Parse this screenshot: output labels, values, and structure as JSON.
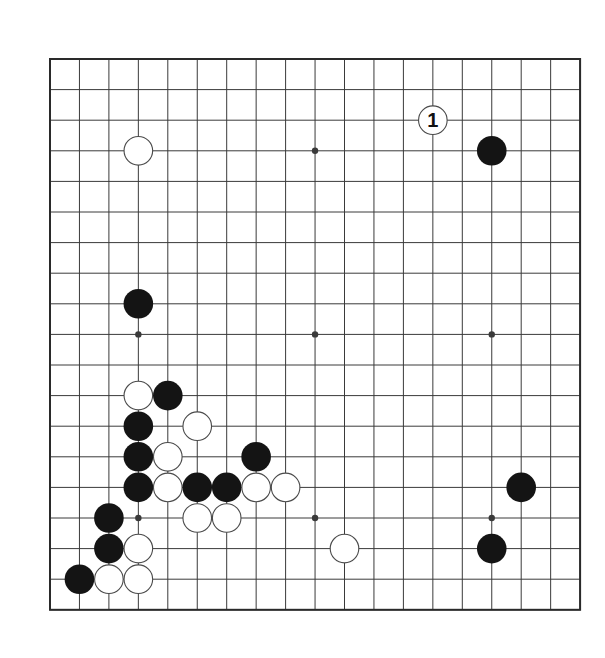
{
  "diagram": {
    "type": "go-board",
    "size": 19,
    "origin": {
      "x": 50,
      "y": 59
    },
    "spacing": {
      "x": 29.45,
      "y": 30.6
    },
    "stone_radius": 14.8,
    "colors": {
      "background": "#ffffff",
      "line": "#3a3a3a",
      "border": "#2a2a2a",
      "black_stone": "#141414",
      "white_stone_fill": "#ffffff",
      "white_stone_stroke": "#4a4a4a",
      "label": "#111111"
    },
    "star_points": [
      [
        3,
        3
      ],
      [
        9,
        3
      ],
      [
        15,
        3
      ],
      [
        3,
        9
      ],
      [
        9,
        9
      ],
      [
        15,
        9
      ],
      [
        3,
        15
      ],
      [
        9,
        15
      ],
      [
        15,
        15
      ]
    ],
    "stones": [
      {
        "col": 3,
        "row": 3,
        "color": "white"
      },
      {
        "col": 15,
        "row": 3,
        "color": "black"
      },
      {
        "col": 13,
        "row": 2,
        "color": "white",
        "label": "1"
      },
      {
        "col": 3,
        "row": 8,
        "color": "black"
      },
      {
        "col": 3,
        "row": 11,
        "color": "white"
      },
      {
        "col": 4,
        "row": 11,
        "color": "black"
      },
      {
        "col": 3,
        "row": 12,
        "color": "black"
      },
      {
        "col": 5,
        "row": 12,
        "color": "white"
      },
      {
        "col": 3,
        "row": 13,
        "color": "black"
      },
      {
        "col": 4,
        "row": 13,
        "color": "white"
      },
      {
        "col": 7,
        "row": 13,
        "color": "black"
      },
      {
        "col": 3,
        "row": 14,
        "color": "black"
      },
      {
        "col": 4,
        "row": 14,
        "color": "white"
      },
      {
        "col": 5,
        "row": 14,
        "color": "black"
      },
      {
        "col": 6,
        "row": 14,
        "color": "black"
      },
      {
        "col": 7,
        "row": 14,
        "color": "white"
      },
      {
        "col": 8,
        "row": 14,
        "color": "white"
      },
      {
        "col": 16,
        "row": 14,
        "color": "black"
      },
      {
        "col": 2,
        "row": 15,
        "color": "black"
      },
      {
        "col": 5,
        "row": 15,
        "color": "white"
      },
      {
        "col": 6,
        "row": 15,
        "color": "white"
      },
      {
        "col": 2,
        "row": 16,
        "color": "black"
      },
      {
        "col": 3,
        "row": 16,
        "color": "white"
      },
      {
        "col": 10,
        "row": 16,
        "color": "white"
      },
      {
        "col": 15,
        "row": 16,
        "color": "black"
      },
      {
        "col": 1,
        "row": 17,
        "color": "black"
      },
      {
        "col": 2,
        "row": 17,
        "color": "white"
      },
      {
        "col": 3,
        "row": 17,
        "color": "white"
      }
    ]
  }
}
